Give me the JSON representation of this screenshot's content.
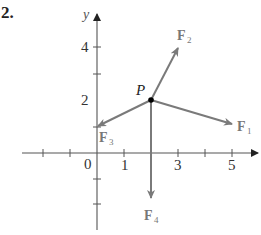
{
  "problem_number": "2.",
  "colors": {
    "axis": "#444444",
    "vector": "#7a7a7a",
    "point": "#000000",
    "label": "#777777"
  },
  "axes": {
    "x_label": "x",
    "y_label": "y",
    "x_tick_labels": [
      {
        "value": 0,
        "text": "0"
      },
      {
        "value": 1,
        "text": "1"
      },
      {
        "value": 3,
        "text": "3"
      },
      {
        "value": 5,
        "text": "5"
      }
    ],
    "y_tick_labels": [
      {
        "value": 2,
        "text": "2"
      },
      {
        "value": 4,
        "text": "4"
      }
    ],
    "x_ticks": [
      -2,
      -1,
      1,
      2,
      3,
      4,
      5
    ],
    "y_ticks": [
      -2,
      -1,
      1,
      2,
      3,
      4
    ],
    "x_range": [
      -2.5,
      6
    ],
    "y_range": [
      -2.9,
      5.3
    ]
  },
  "point": {
    "label": "P",
    "x": 2,
    "y": 2
  },
  "vectors": [
    {
      "name": "F",
      "sub": "1",
      "from": [
        2,
        2
      ],
      "to": [
        5,
        1
      ]
    },
    {
      "name": "F",
      "sub": "2",
      "from": [
        2,
        2
      ],
      "to": [
        3,
        4
      ]
    },
    {
      "name": "F",
      "sub": "3",
      "from": [
        2,
        2
      ],
      "to": [
        0,
        1
      ]
    },
    {
      "name": "F",
      "sub": "4",
      "from": [
        2,
        2
      ],
      "to": [
        2,
        -1.7
      ]
    }
  ]
}
